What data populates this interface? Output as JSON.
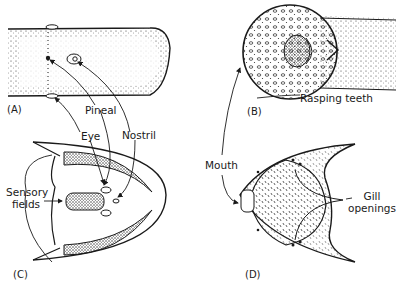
{
  "figure": {
    "panels": [
      {
        "id": "A",
        "label": "(A)",
        "description": "Dorsal view of head"
      },
      {
        "id": "B",
        "label": "(B)",
        "description": "Oral disk with rasping teeth"
      },
      {
        "id": "C",
        "label": "(C)",
        "description": "Head outline with sensory fields"
      },
      {
        "id": "D",
        "label": "(D)",
        "description": "Ventral view with mouth and gill openings"
      }
    ],
    "labels": {
      "pineal": "Pineal",
      "eye": "Eye",
      "nostril": "Nostril",
      "rasping_teeth": "Rasping teeth",
      "mouth": "Mouth",
      "sensory_fields_line1": "Sensory",
      "sensory_fields_line2": "fields",
      "gill_openings_line1": "Gill",
      "gill_openings_line2": "openings"
    },
    "colors": {
      "ink": "#1a1a1a",
      "background": "#ffffff"
    }
  }
}
